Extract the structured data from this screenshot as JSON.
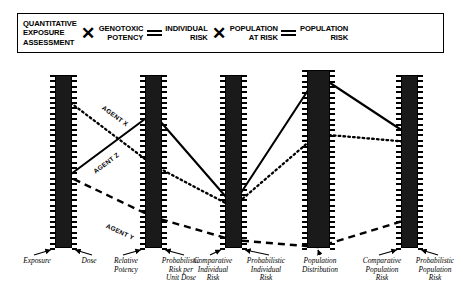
{
  "legend": {
    "terms": [
      {
        "id": "quantitative-exposure-assessment",
        "lines": [
          "QUANTITATIVE",
          "EXPOSURE",
          "ASSESSMENT"
        ]
      },
      {
        "id": "genotoxic-potency",
        "lines": [
          "GENOTOXIC",
          "POTENCY"
        ]
      },
      {
        "id": "individual-risk",
        "lines": [
          "INDIVIDUAL",
          "RISK"
        ]
      },
      {
        "id": "population-at-risk",
        "lines": [
          "POPULATION",
          "AT RISK"
        ]
      },
      {
        "id": "population-risk",
        "lines": [
          "POPULATION",
          "RISK"
        ]
      }
    ],
    "operators": [
      "times",
      "equals",
      "times",
      "equals"
    ],
    "operator_glyphs": {
      "times": "✕",
      "equals": "="
    }
  },
  "axes": [
    {
      "id": "axis-1",
      "label_left": "Exposure",
      "label_right": "Dose",
      "x": 63,
      "top": 18,
      "bottom": 191,
      "width": 17,
      "ticks": 33,
      "arrows": 2,
      "captions": [
        {
          "text": "Exposure",
          "cx": 37
        },
        {
          "text": "Dose",
          "cx": 89
        }
      ]
    },
    {
      "id": "axis-2",
      "x": 153,
      "top": 18,
      "bottom": 191,
      "width": 17,
      "ticks": 33,
      "arrows": 2,
      "captions": [
        {
          "text": "Relative\nPotency",
          "cx": 126
        },
        {
          "text": "Probabilistic\nRisk per\nUnit Dose",
          "cx": 181
        }
      ]
    },
    {
      "id": "axis-3",
      "x": 233,
      "top": 18,
      "bottom": 191,
      "width": 17,
      "ticks": 33,
      "arrows": 2,
      "captions": [
        {
          "text": "Comparative\nIndividual\nRisk",
          "cx": 213
        },
        {
          "text": "Probabilistic\nIndividual\nRisk",
          "cx": 266
        }
      ]
    },
    {
      "id": "axis-4",
      "x": 318,
      "top": 13,
      "bottom": 191,
      "width": 23,
      "ticks": 34,
      "arrows": 1,
      "captions": [
        {
          "text": "Population\nDistribution",
          "cx": 320
        }
      ]
    },
    {
      "id": "axis-5",
      "x": 409,
      "top": 18,
      "bottom": 191,
      "width": 17,
      "ticks": 33,
      "arrows": 2,
      "captions": [
        {
          "text": "Comparative\nPopulation\nRisk",
          "cx": 382
        },
        {
          "text": "Probabilistic\nPopulation\nRisk",
          "cx": 435
        }
      ]
    }
  ],
  "chart_data": {
    "type": "line",
    "title": "",
    "xlabel": "",
    "ylabel": "",
    "grid": false,
    "legend_position": "inline-rotated-labels",
    "categories": [
      "Exposure/Dose",
      "Relative Potency",
      "Comparative Individual Risk",
      "Population Distribution",
      "Comparative Population Risk"
    ],
    "series": [
      {
        "name": "AGENT X",
        "style": "dotted",
        "values": [
          40,
          108,
          150,
          77,
          85
        ],
        "points": [
          [
            63,
            40
          ],
          [
            153,
            108
          ],
          [
            233,
            150
          ],
          [
            318,
            77
          ],
          [
            409,
            85
          ]
        ],
        "label_at": [
          105,
          47
        ]
      },
      {
        "name": "AGENT Z",
        "style": "solid",
        "values": [
          123,
          56,
          148,
          18,
          78
        ],
        "points": [
          [
            63,
            123
          ],
          [
            153,
            56
          ],
          [
            233,
            148
          ],
          [
            318,
            18
          ],
          [
            409,
            78
          ]
        ],
        "label_at": [
          92,
          112
        ]
      },
      {
        "name": "AGENT Y",
        "style": "dashed",
        "values": [
          117,
          160,
          183,
          190,
          162
        ],
        "points": [
          [
            63,
            117
          ],
          [
            153,
            160
          ],
          [
            233,
            183
          ],
          [
            318,
            190
          ],
          [
            409,
            162
          ]
        ],
        "label_at": [
          108,
          165
        ]
      }
    ]
  },
  "colors": {
    "ink": "#000000",
    "bar_fill": "#1a1a1a",
    "background": "#ffffff"
  }
}
